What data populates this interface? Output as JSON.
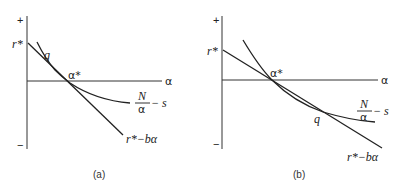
{
  "panels": [
    {
      "caption": "(a)",
      "axis": {
        "plus": "+",
        "minus": "−",
        "x_label": "α"
      },
      "labels": {
        "r_star": "r*",
        "q": "q",
        "alpha_star": "α*",
        "curve_num": "N",
        "curve_den": "α",
        "curve_tail": "− s",
        "line": "r*−bα"
      }
    },
    {
      "caption": "(b)",
      "axis": {
        "plus": "+",
        "minus": "−",
        "x_label": "α"
      },
      "labels": {
        "r_star": "r*",
        "q": "q",
        "alpha_star": "α*",
        "curve_num": "N",
        "curve_den": "α",
        "curve_tail": "− s",
        "line": "r*−bα"
      }
    }
  ]
}
